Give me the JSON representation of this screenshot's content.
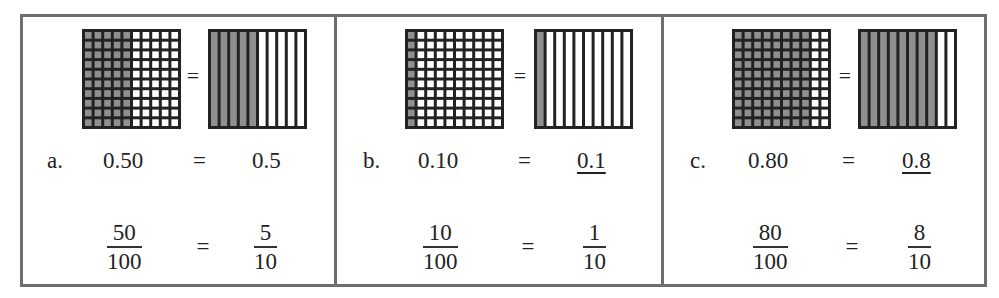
{
  "colors": {
    "border": "#6e6e6e",
    "grid_line": "#222222",
    "shaded": "#8f8f8f",
    "unshaded": "#ffffff",
    "text": "#222222"
  },
  "equals": "=",
  "panels": [
    {
      "label": "a.",
      "hundredths_grid": {
        "rows": 10,
        "cols": 10,
        "shaded_columns": 5
      },
      "tenths_grid": {
        "strips": 10,
        "shaded_strips": 5
      },
      "decimal_left": "0.50",
      "decimal_right": "0.5",
      "decimal_right_underlined": false,
      "fraction_left": {
        "numerator": "50",
        "denominator": "100"
      },
      "fraction_right": {
        "numerator": "5",
        "denominator": "10"
      }
    },
    {
      "label": "b.",
      "hundredths_grid": {
        "rows": 10,
        "cols": 10,
        "shaded_columns": 1
      },
      "tenths_grid": {
        "strips": 10,
        "shaded_strips": 1
      },
      "decimal_left": "0.10",
      "decimal_right": "0.1",
      "decimal_right_underlined": true,
      "fraction_left": {
        "numerator": "10",
        "denominator": "100"
      },
      "fraction_right": {
        "numerator": "1",
        "denominator": "10"
      }
    },
    {
      "label": "c.",
      "hundredths_grid": {
        "rows": 10,
        "cols": 10,
        "shaded_columns": 8
      },
      "tenths_grid": {
        "strips": 10,
        "shaded_strips": 8
      },
      "decimal_left": "0.80",
      "decimal_right": "0.8",
      "decimal_right_underlined": true,
      "fraction_left": {
        "numerator": "80",
        "denominator": "100"
      },
      "fraction_right": {
        "numerator": "8",
        "denominator": "10"
      }
    }
  ]
}
